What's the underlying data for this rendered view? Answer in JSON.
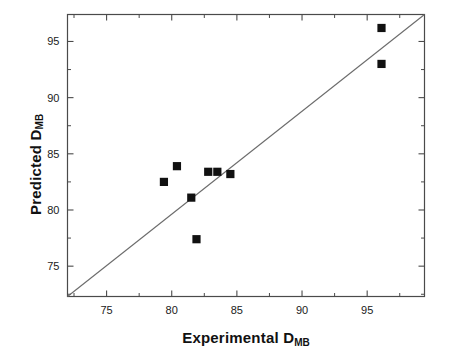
{
  "chart_data": {
    "type": "scatter",
    "title": "",
    "xlabel": "Experimental D",
    "xlabel_sub": "MB",
    "ylabel": "Predicted D",
    "ylabel_sub": "MB",
    "xlim": [
      72.0,
      99.4
    ],
    "ylim": [
      72.3,
      97.4
    ],
    "xticks": [
      75,
      80,
      85,
      90,
      95
    ],
    "yticks": [
      75,
      80,
      85,
      90,
      95
    ],
    "xtick_labels": [
      "75",
      "80",
      "85",
      "90",
      "95"
    ],
    "ytick_labels": [
      "75",
      "80",
      "85",
      "90",
      "95"
    ],
    "minor_ticks": true,
    "grid": false,
    "legend": "none",
    "marker": "filled-square",
    "marker_color": "#111111",
    "line_color": "#6b6b6b",
    "axis_color": "#4a4a4a",
    "points": [
      {
        "x": 79.4,
        "y": 82.5
      },
      {
        "x": 80.4,
        "y": 83.9
      },
      {
        "x": 81.5,
        "y": 81.1
      },
      {
        "x": 81.9,
        "y": 77.4
      },
      {
        "x": 82.8,
        "y": 83.4
      },
      {
        "x": 83.5,
        "y": 83.4
      },
      {
        "x": 84.5,
        "y": 83.2
      },
      {
        "x": 96.1,
        "y": 96.2
      },
      {
        "x": 96.1,
        "y": 93.0
      }
    ],
    "reference_line": {
      "description": "y = x identity line",
      "x0": 72.0,
      "y0": 72.3,
      "x1": 99.4,
      "y1": 97.4
    }
  }
}
